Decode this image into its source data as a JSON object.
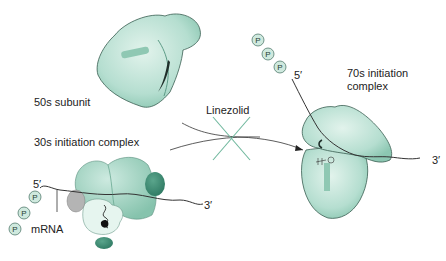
{
  "labels": {
    "subunit_50s": "50s subunit",
    "complex_30s": "30s initiation complex",
    "drug": "Linezolid",
    "complex_70s_line1": "70s initiation",
    "complex_70s_line2": "complex",
    "mrna": "mRNA",
    "five_prime_left": "5′",
    "three_prime_left": "3′",
    "five_prime_right": "5′",
    "three_prime_right": "3′",
    "phosphate": "P"
  },
  "colors": {
    "ribosome_light": "#bfe3d6",
    "ribosome_mid": "#8fcab5",
    "ribosome_dark": "#3f8f77",
    "factor_gray": "#b3b3b3",
    "block_x": "#6fb79d",
    "line": "#333333"
  }
}
